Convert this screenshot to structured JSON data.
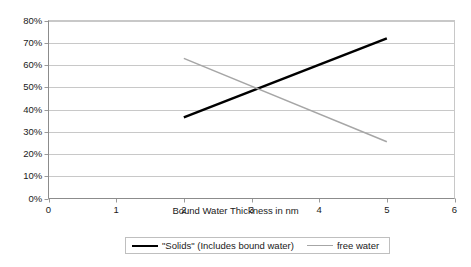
{
  "chart_data": {
    "type": "line",
    "title": "",
    "xlabel": "Bound Water Thickness in nm",
    "ylabel": "",
    "xlim": [
      0,
      6
    ],
    "ylim": [
      0,
      0.8
    ],
    "xticks": [
      "0",
      "1",
      "2",
      "3",
      "4",
      "5",
      "6"
    ],
    "yticks": [
      "0%",
      "10%",
      "20%",
      "30%",
      "40%",
      "50%",
      "60%",
      "70%",
      "80%"
    ],
    "ytick_values": [
      0,
      10,
      20,
      30,
      40,
      50,
      60,
      70,
      80
    ],
    "xtick_values": [
      0,
      1,
      2,
      3,
      4,
      5,
      6
    ],
    "grid": "horizontal",
    "legend_position": "bottom",
    "series": [
      {
        "name": "\"Solids\" (Includes bound water)",
        "color": "#000000",
        "width": 2.5,
        "x": [
          2,
          5
        ],
        "values": [
          36.5,
          72
        ]
      },
      {
        "name": "free water",
        "color": "#a6a6a6",
        "width": 1.5,
        "x": [
          2,
          5
        ],
        "values": [
          63,
          25.5
        ]
      }
    ],
    "annotations": []
  },
  "legend": {
    "entries": [
      {
        "label": "\"Solids\" (Includes bound water)"
      },
      {
        "label": "free water"
      }
    ]
  },
  "axes": {
    "x_title": "Bound Water Thickness in nm"
  },
  "colors": {
    "solids_line": "#000000",
    "free_water_line": "#a6a6a6",
    "grid": "#c8c8c8",
    "axis": "#9a9a9a",
    "background": "#ffffff"
  }
}
